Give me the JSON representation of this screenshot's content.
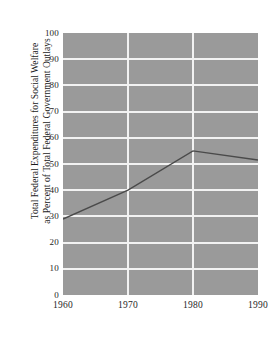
{
  "figure": {
    "background_color": "#ffffff",
    "plot_background_color": "#9a9a9a",
    "gridline_color": "#f2f2f2",
    "line_color": "#4a4a4a",
    "text_color": "#262626",
    "top_caption_partial": ""
  },
  "axes": {
    "y_title_line1": "Total Federal Expenditures for Social Welfare",
    "y_title_line2": "as Percent of Total Federal Government Outlays",
    "y_ticks": [
      "0",
      "10",
      "20",
      "30",
      "40",
      "50",
      "60",
      "70",
      "80",
      "90",
      "100"
    ],
    "x_ticks": [
      "1960",
      "1970",
      "1980",
      "1990"
    ]
  },
  "chart_data": {
    "type": "line",
    "title": "",
    "xlabel": "",
    "ylabel": "Total Federal Expenditures for Social Welfare as Percent of Total Federal Government Outlays",
    "x": [
      1960,
      1970,
      1980,
      1990
    ],
    "values": [
      29,
      40,
      55,
      51.5
    ],
    "xlim": [
      1960,
      1990
    ],
    "ylim": [
      0,
      100
    ],
    "ytick_values": [
      0,
      10,
      20,
      30,
      40,
      50,
      60,
      70,
      80,
      90,
      100
    ],
    "xtick_values": [
      1960,
      1970,
      1980,
      1990
    ],
    "grid": true,
    "grid_color": "#f2f2f2",
    "legend": null,
    "series": [
      {
        "name": "Social welfare share of federal outlays",
        "x": [
          1960,
          1970,
          1980,
          1990
        ],
        "values": [
          29,
          40,
          55,
          51.5
        ]
      }
    ]
  }
}
